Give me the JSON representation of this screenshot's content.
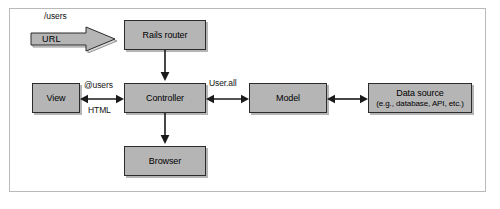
{
  "diagram": {
    "colors": {
      "box_fill": "#b5b5b5",
      "box_border": "#2b2b2b",
      "frame_border": "#b9b9b9",
      "arrow": "#1a1a1a",
      "background": "#ffffff"
    },
    "nodes": {
      "url_arrow": {
        "label": "URL"
      },
      "rails_router": {
        "label": "Rails router"
      },
      "view": {
        "label": "View"
      },
      "controller": {
        "label": "Controller"
      },
      "browser": {
        "label": "Browser"
      },
      "model": {
        "label": "Model"
      },
      "data_source": {
        "label": "Data source",
        "sublabel": "(e.g., database, API, etc.)"
      }
    },
    "edge_labels": {
      "request_path": "/users",
      "view_to_controller": "@users",
      "controller_to_view": "HTML",
      "controller_to_model": "User.all"
    }
  }
}
